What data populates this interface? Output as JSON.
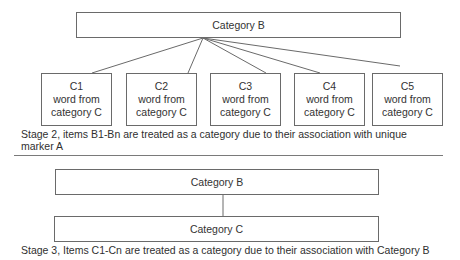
{
  "stage2": {
    "top_box": {
      "label": "Category B"
    },
    "children": [
      {
        "id": "C1",
        "line1": "word from",
        "line2": "category C"
      },
      {
        "id": "C2",
        "line1": "word from",
        "line2": "category C"
      },
      {
        "id": "C3",
        "line1": "word from",
        "line2": "category C"
      },
      {
        "id": "C4",
        "line1": "word from",
        "line2": "category C"
      },
      {
        "id": "C5",
        "line1": "word from",
        "line2": "category C"
      }
    ],
    "caption": "Stage 2, items B1-Bn are treated as a category due to their association with unique marker A"
  },
  "stage3": {
    "top_box": {
      "label": "Category B"
    },
    "bottom_box": {
      "label": "Category C"
    },
    "caption": "Stage 3, Items C1-Cn are treated as a category due to their association with Category B"
  },
  "colors": {
    "line": "#6a6a6a",
    "text": "#2f2f2f",
    "background": "#ffffff"
  }
}
